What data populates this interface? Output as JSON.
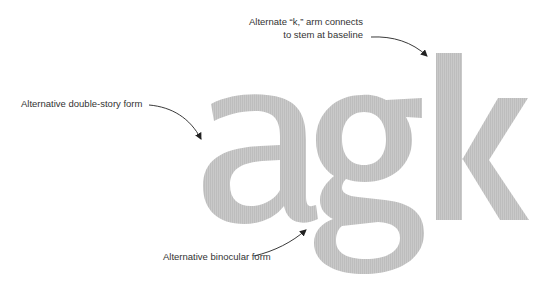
{
  "specimen": {
    "letters": "agk",
    "glyph_color": "#c6c6c6"
  },
  "annotations": [
    {
      "id": "k",
      "text_line1": "Alternate “k,” arm connects",
      "text_line2": "to stem at baseline"
    },
    {
      "id": "a",
      "text": "Alternative double-story form"
    },
    {
      "id": "g",
      "text": "Alternative binocular form"
    }
  ],
  "colors": {
    "text": "#333333",
    "arrow": "#222222",
    "glyph": "#c6c6c6",
    "background": "#ffffff"
  }
}
